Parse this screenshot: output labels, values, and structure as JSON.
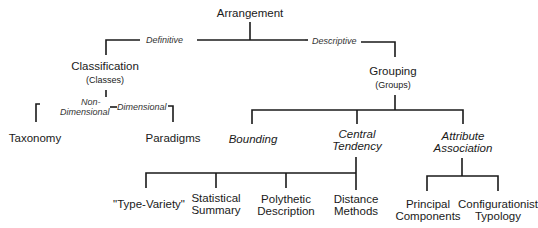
{
  "root": {
    "label": "Arrangement"
  },
  "edges": {
    "definitive": "Definitive",
    "descriptive": "Descriptive",
    "non_dimensional_1": "Non-",
    "non_dimensional_2": "Dimensional",
    "dimensional": "Dimensional"
  },
  "classification": {
    "label": "Classification",
    "sub": "(Classes)"
  },
  "grouping": {
    "label": "Grouping",
    "sub": "(Groups)"
  },
  "taxonomy": {
    "label": "Taxonomy"
  },
  "paradigms": {
    "label": "Paradigms"
  },
  "bounding": {
    "label": "Bounding"
  },
  "central_tendency": {
    "line1": "Central",
    "line2": "Tendency"
  },
  "attribute_association": {
    "line1": "Attribute",
    "line2": "Association"
  },
  "leaves": {
    "type_variety": {
      "line1": "\"Type-Variety\""
    },
    "statistical_summary": {
      "line1": "Statistical",
      "line2": "Summary"
    },
    "polythetic_description": {
      "line1": "Polythetic",
      "line2": "Description"
    },
    "distance_methods": {
      "line1": "Distance",
      "line2": "Methods"
    },
    "principal_components": {
      "line1": "Principal",
      "line2": "Components"
    },
    "configurationist_typology": {
      "line1": "Configurationist",
      "line2": "Typology"
    }
  }
}
